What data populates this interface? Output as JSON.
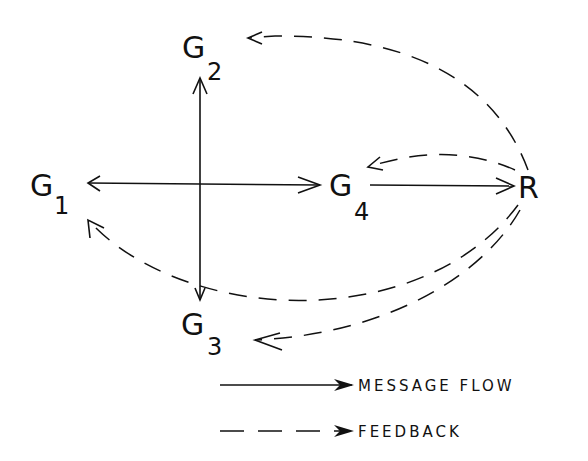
{
  "diagram": {
    "nodes": [
      {
        "id": "G1",
        "label": "G",
        "sub": "1"
      },
      {
        "id": "G2",
        "label": "G",
        "sub": "2"
      },
      {
        "id": "G3",
        "label": "G",
        "sub": "3"
      },
      {
        "id": "G4",
        "label": "G",
        "sub": "4"
      },
      {
        "id": "R",
        "label": "R",
        "sub": ""
      }
    ],
    "edges": [
      {
        "from": "center",
        "to": "G1",
        "type": "message"
      },
      {
        "from": "center",
        "to": "G2",
        "type": "message"
      },
      {
        "from": "center",
        "to": "G3",
        "type": "message"
      },
      {
        "from": "center",
        "to": "G4",
        "type": "message"
      },
      {
        "from": "G4",
        "to": "R",
        "type": "message"
      },
      {
        "from": "R",
        "to": "G1",
        "type": "feedback"
      },
      {
        "from": "R",
        "to": "G2",
        "type": "feedback"
      },
      {
        "from": "R",
        "to": "G3",
        "type": "feedback"
      },
      {
        "from": "R",
        "to": "G4",
        "type": "feedback"
      }
    ],
    "legend": [
      {
        "label": "MESSAGE FLOW",
        "style": "solid"
      },
      {
        "label": "FEEDBACK",
        "style": "dashed"
      }
    ]
  }
}
